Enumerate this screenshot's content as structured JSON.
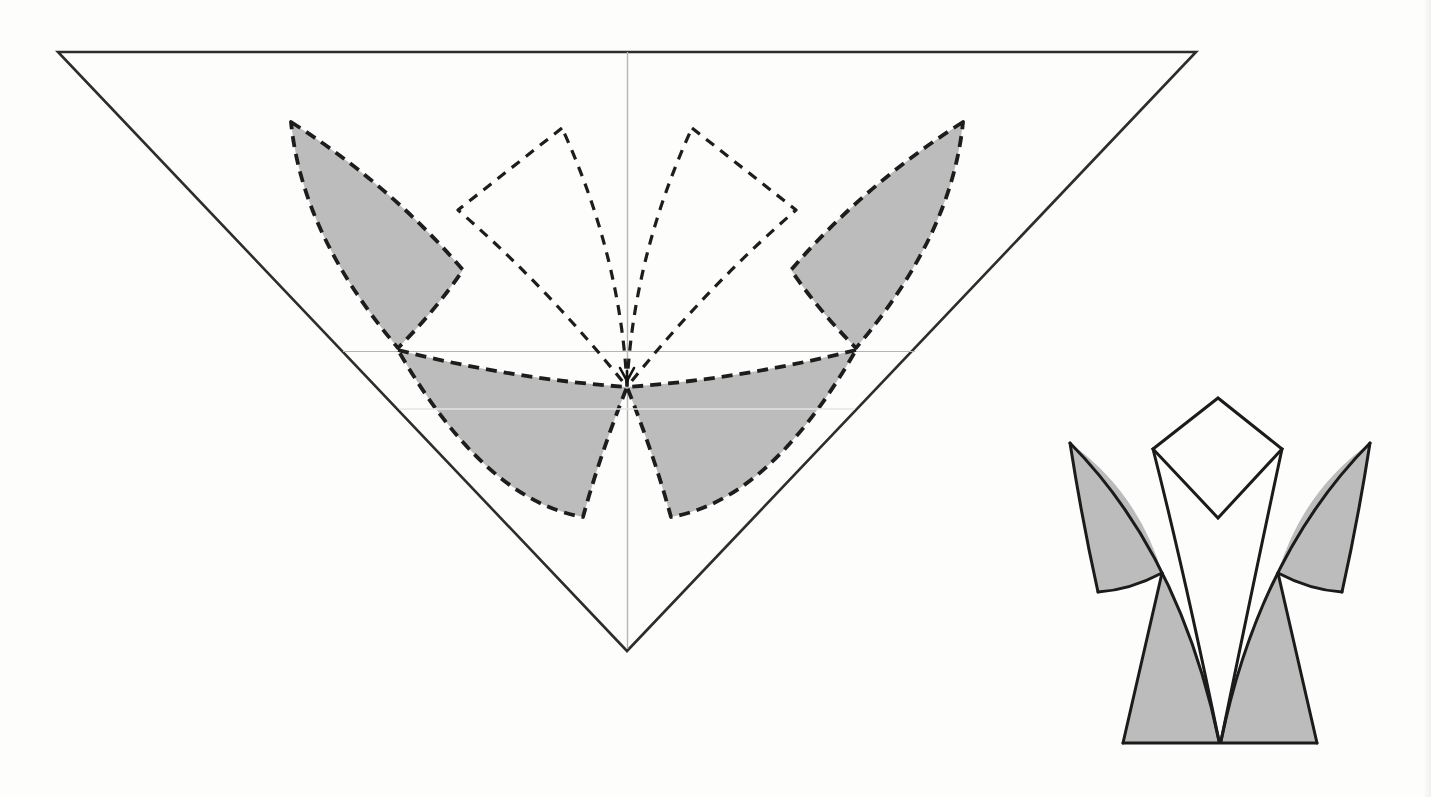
{
  "page": {
    "kind": "scanned origami diagram page (no text content)",
    "background": "#fdfdfc",
    "width": 1431,
    "height": 797
  },
  "colors": {
    "paper_outline": "#2d2d2d",
    "crease_dash": "#1d1d1d",
    "shade_gray": "#bcbcbc",
    "reference_line": "#b5b5b5",
    "faint_scan_line": "#e4e4e4",
    "model_stroke": "#1b1b1b",
    "model_paper_white": "#fdfdfc"
  },
  "diagram": {
    "canvas": {
      "width": 1431,
      "height": 797
    },
    "groups": [
      {
        "name": "crease-pattern",
        "description": "Large inverted triangle of paper with six curved dashed petal creases radiating from an interior center point (627,387); outer-left, outer-right and the two lower petals are shaded gray, the two upper-middle petals are unshaded; thin gray reference lines cross at the center",
        "shapes": [
          {
            "name": "paper-triangle-outline",
            "d": "M 58 52 L 1196 52 L 627 651 Z",
            "fill": "none",
            "stroke": "#2d2d2d",
            "width": 2.6,
            "join": "miter"
          },
          {
            "name": "vertical-centerline",
            "d": "M 627.5 52 L 627.5 649",
            "fill": "none",
            "stroke": "#b5b5b5",
            "width": 1.4
          },
          {
            "name": "horizontal-reference-line",
            "d": "M 343 351.5 L 915 351.5",
            "fill": "none",
            "stroke": "#b5b5b5",
            "width": 1.2
          },
          {
            "name": "petal-outer-left",
            "d": "M 291 122 Q 390 185 463 270 Q 435 311 398 348 Q 302 235 291 122 Z",
            "fill": "#bcbcbc",
            "stroke": "#1d1d1d",
            "width": 3.8,
            "dash": "11 7"
          },
          {
            "name": "petal-outer-right",
            "d": "M 963 122 Q 864 185 791 270 Q 819 311 856 348 Q 952 235 963 122 Z",
            "fill": "#bcbcbc",
            "stroke": "#1d1d1d",
            "width": 3.8,
            "dash": "11 7"
          },
          {
            "name": "petal-lower-left",
            "d": "M 398 350 Q 512 379 627 387 Q 600 455 583 517 Q 484 500 398 350 Z",
            "fill": "#bcbcbc",
            "stroke": "#1d1d1d",
            "width": 3.8,
            "dash": "11 7"
          },
          {
            "name": "petal-lower-right",
            "d": "M 856 350 Q 742 379 627 387 Q 654 455 671 517 Q 770 500 856 350 Z",
            "fill": "#bcbcbc",
            "stroke": "#1d1d1d",
            "width": 3.8,
            "dash": "11 7"
          },
          {
            "name": "petal-inner-left",
            "d": "M 562 128 L 458 210 Q 548 288 627 387 Q 621 257 562 128 Z",
            "fill": "none",
            "stroke": "#1d1d1d",
            "width": 3.2,
            "dash": "10 8"
          },
          {
            "name": "petal-inner-right",
            "d": "M 692 128 L 796 210 Q 706 288 627 387 Q 633 257 692 128 Z",
            "fill": "none",
            "stroke": "#1d1d1d",
            "width": 3.2,
            "dash": "10 8"
          },
          {
            "name": "faint-horizontal-scan-line",
            "d": "M 399 409 L 855 409",
            "fill": "none",
            "stroke": "#e4e4e4",
            "width": 1.6
          },
          {
            "name": "center-arrow-marker",
            "d": "M 620 368 L 627 381 L 634 368 M 627 371 L 627 382",
            "fill": "none",
            "stroke": "#141414",
            "width": 2.6,
            "cap": "round"
          }
        ]
      },
      {
        "name": "folded-model",
        "description": "Folded result: lily-like figure with a diamond head, two gray curved sleeves at the sides, a white V of curved strips sweeping to a bottom point, and two gray flared legs on a horizontal base",
        "shapes": [
          {
            "name": "leg-left-fill",
            "d": "M 1162 573 L 1123 743 L 1219 743 Q 1196 643 1162 573 Z",
            "fill": "#bcbcbc",
            "stroke": "none"
          },
          {
            "name": "leg-right-fill",
            "d": "M 1278 573 L 1317 743 L 1221 743 Q 1244 643 1278 573 Z",
            "fill": "#bcbcbc",
            "stroke": "none"
          },
          {
            "name": "sleeve-left-fill",
            "d": "M 1070 443 Q 1138 492 1162 573 Q 1130 590 1098 592 Q 1082 520 1070 443 Z",
            "fill": "#bcbcbc",
            "stroke": "none"
          },
          {
            "name": "sleeve-right-fill",
            "d": "M 1370 443 Q 1302 492 1278 573 Q 1310 590 1342 592 Q 1358 520 1370 443 Z",
            "fill": "#bcbcbc",
            "stroke": "none"
          },
          {
            "name": "wing-curve-left",
            "d": "M 1070 443 Q 1180 554 1219 741",
            "fill": "none",
            "stroke": "#1b1b1b",
            "width": 3,
            "cap": "round"
          },
          {
            "name": "wing-curve-right",
            "d": "M 1370 443 Q 1260 554 1221 741",
            "fill": "none",
            "stroke": "#1b1b1b",
            "width": 3,
            "cap": "round"
          },
          {
            "name": "inner-curve-left",
            "d": "M 1153 449 Q 1185 575 1219 741",
            "fill": "none",
            "stroke": "#1b1b1b",
            "width": 3,
            "cap": "round"
          },
          {
            "name": "inner-curve-right",
            "d": "M 1282 449 Q 1255 575 1221 741",
            "fill": "none",
            "stroke": "#1b1b1b",
            "width": 3,
            "cap": "round"
          },
          {
            "name": "sleeve-left-outer-edge",
            "d": "M 1070 443 Q 1082 520 1098 592",
            "fill": "none",
            "stroke": "#1b1b1b",
            "width": 3,
            "cap": "round"
          },
          {
            "name": "sleeve-left-bottom-edge",
            "d": "M 1098 592 Q 1130 590 1162 573",
            "fill": "none",
            "stroke": "#1b1b1b",
            "width": 3,
            "cap": "round"
          },
          {
            "name": "sleeve-right-outer-edge",
            "d": "M 1370 443 Q 1358 520 1342 592",
            "fill": "none",
            "stroke": "#1b1b1b",
            "width": 3,
            "cap": "round"
          },
          {
            "name": "sleeve-right-bottom-edge",
            "d": "M 1342 592 Q 1310 590 1278 573",
            "fill": "none",
            "stroke": "#1b1b1b",
            "width": 3,
            "cap": "round"
          },
          {
            "name": "leg-left-outer-edge",
            "d": "M 1162 573 L 1123 743",
            "fill": "none",
            "stroke": "#1b1b1b",
            "width": 3,
            "cap": "round"
          },
          {
            "name": "leg-right-outer-edge",
            "d": "M 1278 573 L 1317 743",
            "fill": "none",
            "stroke": "#1b1b1b",
            "width": 3,
            "cap": "round"
          },
          {
            "name": "base-line",
            "d": "M 1123 743 L 1317 743",
            "fill": "none",
            "stroke": "#1b1b1b",
            "width": 3,
            "cap": "round"
          },
          {
            "name": "diamond-head",
            "d": "M 1218 398 L 1153 449 L 1218 518 L 1282 449 Z",
            "fill": "#fdfdfc",
            "stroke": "#1b1b1b",
            "width": 3,
            "join": "miter"
          }
        ]
      }
    ]
  }
}
